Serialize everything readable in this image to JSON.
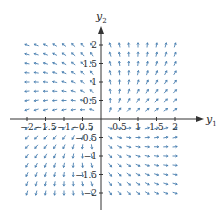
{
  "chart_data": {
    "type": "vector_field",
    "title": "",
    "xlabel": "y",
    "xlabel_sub": "1",
    "ylabel": "y",
    "ylabel_sub": "2",
    "xlim": [
      -2,
      2
    ],
    "ylim": [
      -2,
      2
    ],
    "grid": false,
    "x_ticks": [
      -2,
      -1.5,
      -1,
      -0.5,
      0.5,
      1,
      1.5,
      2
    ],
    "x_tick_labels": [
      "−2",
      "−1.5",
      "−1",
      "−0.5",
      "0.5",
      "1",
      "1.5",
      "2"
    ],
    "y_ticks": [
      2,
      1.5,
      1,
      0.5,
      -0.5,
      -1,
      -1.5,
      -2
    ],
    "y_tick_labels": [
      "2",
      "1.5",
      "1",
      "0.5",
      "−0.5",
      "−1",
      "−1.5",
      "−2"
    ],
    "field": {
      "description": "Direction field (normalized arrows) on a grid from -2 to 2, step 0.25",
      "grid_step": 0.25,
      "dy1": {
        "a": 1.0,
        "b": -0.5
      },
      "dy2": {
        "c": 0.5,
        "d": 1.0
      }
    },
    "colors": {
      "vectors": "#4a7fb0",
      "axes": "#333333",
      "text": "#2a2a2a"
    }
  }
}
